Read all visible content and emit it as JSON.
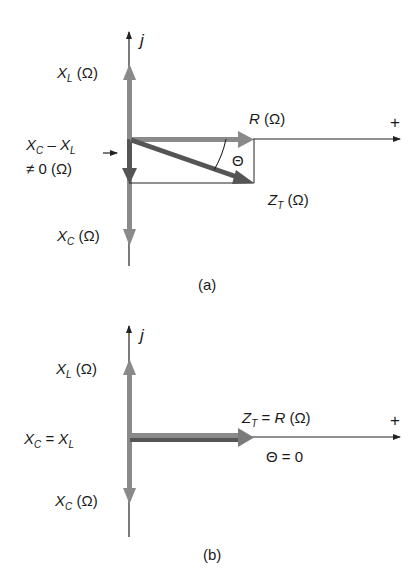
{
  "colors": {
    "axis": "#222222",
    "phasor_light": "#8a8a8a",
    "phasor_dark": "#555555",
    "text": "#1a1a1a"
  },
  "panel_a": {
    "caption": "(a)",
    "imag_axis_label": "j",
    "real_axis_label": "+",
    "xl_label": {
      "sym": "X",
      "sub": "L",
      "unit": " (Ω)"
    },
    "xc_label": {
      "sym": "X",
      "sub": "C",
      "unit": " (Ω)"
    },
    "r_label": {
      "sym": "R",
      "unit": " (Ω)"
    },
    "zt_label": {
      "sym": "Z",
      "sub": "T",
      "unit": " (Ω)"
    },
    "theta_label": "Θ",
    "net_reactance_label": {
      "line1_sym1": "X",
      "line1_sub1": "C",
      "line1_op": " – ",
      "line1_sym2": "X",
      "line1_sub2": "L",
      "line2": "≠ 0 (Ω)"
    }
  },
  "panel_b": {
    "caption": "(b)",
    "imag_axis_label": "j",
    "real_axis_label": "+",
    "xl_label": {
      "sym": "X",
      "sub": "L",
      "unit": " (Ω)"
    },
    "xc_label": {
      "sym": "X",
      "sub": "C",
      "unit": " (Ω)"
    },
    "equal_label": {
      "sym1": "X",
      "sub1": "C",
      "op": " = ",
      "sym2": "X",
      "sub2": "L"
    },
    "zt_label": {
      "sym": "Z",
      "sub": "T",
      "op": " = ",
      "sym2": "R",
      "unit": " (Ω)"
    },
    "theta_label": "Θ = 0"
  }
}
